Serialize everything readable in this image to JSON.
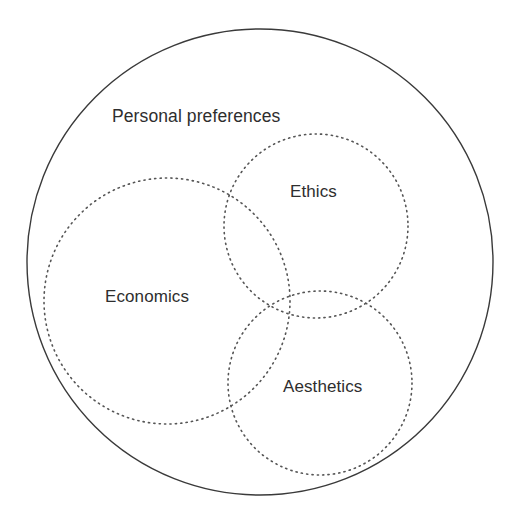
{
  "diagram": {
    "type": "venn",
    "background_color": "#ffffff",
    "universe": {
      "name": "universe-set",
      "label": "Personal preferences",
      "stroke_color": "#3a3a3a",
      "stroke_style": "solid",
      "center_x": 260,
      "center_y": 262,
      "radius": 233
    },
    "sets": [
      {
        "name": "economics-set",
        "label": "Economics",
        "stroke_color": "#555555",
        "stroke_style": "dotted",
        "center_x": 167,
        "center_y": 301,
        "radius": 123,
        "label_x": 105,
        "label_y": 288
      },
      {
        "name": "ethics-set",
        "label": "Ethics",
        "stroke_color": "#555555",
        "stroke_style": "dotted",
        "center_x": 316,
        "center_y": 226,
        "radius": 92,
        "label_x": 290,
        "label_y": 183
      },
      {
        "name": "aesthetics-set",
        "label": "Aesthetics",
        "stroke_color": "#555555",
        "stroke_style": "dotted",
        "center_x": 320,
        "center_y": 383,
        "radius": 92,
        "label_x": 283,
        "label_y": 378
      }
    ],
    "labels": {
      "universe": "Personal preferences",
      "economics": "Economics",
      "ethics": "Ethics",
      "aesthetics": "Aesthetics"
    }
  }
}
